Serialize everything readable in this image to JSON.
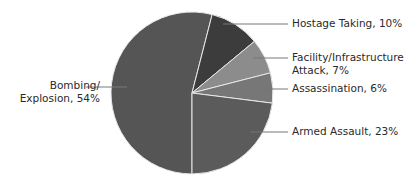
{
  "chart_data": {
    "type": "pie",
    "title": "",
    "start_angle_deg": 180,
    "direction": "clockwise",
    "slices": [
      {
        "label_line1": "Bombing/",
        "label_line2": "Explosion, 54%",
        "name": "Bombing/Explosion",
        "value": 54,
        "color": "#555555"
      },
      {
        "label_line1": "Hostage Taking, 10%",
        "label_line2": "",
        "name": "Hostage Taking",
        "value": 10,
        "color": "#3c3c3c"
      },
      {
        "label_line1": "Facility/Infrastructure",
        "label_line2": "Attack, 7%",
        "name": "Facility/Infrastructure Attack",
        "value": 7,
        "color": "#8c8c8c"
      },
      {
        "label_line1": "Assassination, 6%",
        "label_line2": "",
        "name": "Assassination",
        "value": 6,
        "color": "#777777"
      },
      {
        "label_line1": "Armed Assault, 23%",
        "label_line2": "",
        "name": "Armed Assault",
        "value": 23,
        "color": "#5b5b5b"
      }
    ],
    "legend": "none (leader-line labels)"
  }
}
